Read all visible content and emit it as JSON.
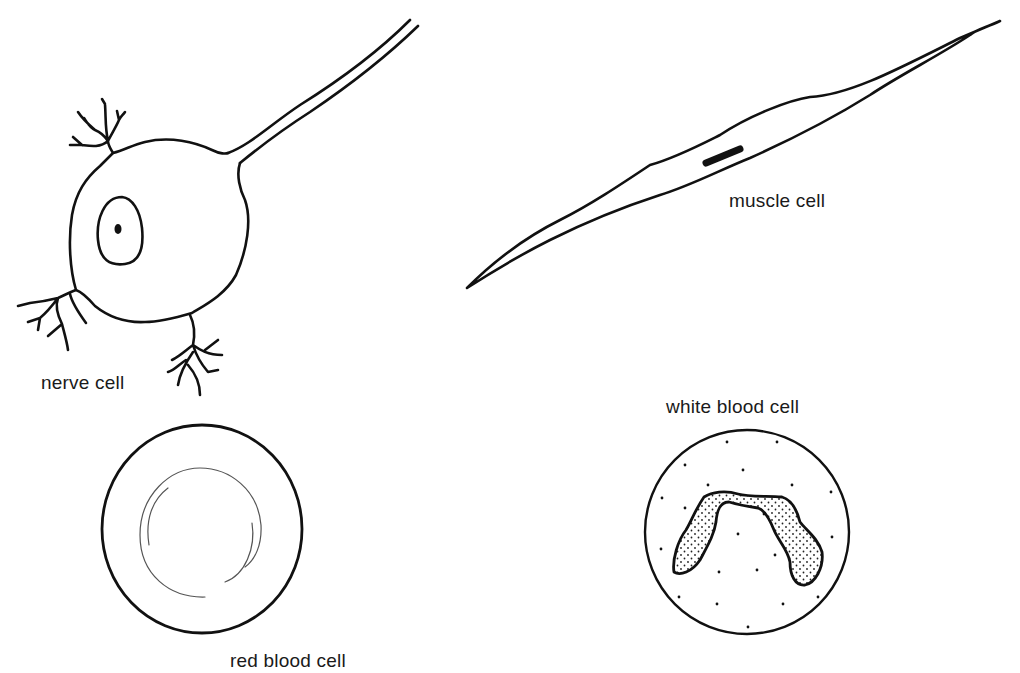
{
  "figure": {
    "cells": [
      {
        "id": "nerve",
        "label": "nerve cell"
      },
      {
        "id": "muscle",
        "label": "muscle cell"
      },
      {
        "id": "red",
        "label": "red blood cell"
      },
      {
        "id": "white",
        "label": "white blood cell"
      }
    ],
    "colors": {
      "ink": "#111111",
      "background": "#ffffff"
    }
  }
}
